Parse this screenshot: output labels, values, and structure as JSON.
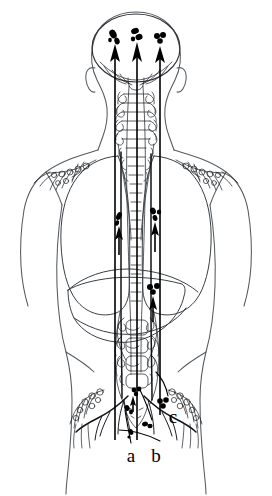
{
  "figure": {
    "view": "posterior",
    "background_color": "#ffffff",
    "line_color": "#1c2024",
    "lesion_color": "#000000"
  },
  "labels": [
    {
      "id": "a",
      "text": "a",
      "x": 131,
      "y": 455
    },
    {
      "id": "b",
      "text": "b",
      "x": 155,
      "y": 455
    },
    {
      "id": "c",
      "text": "c",
      "x": 171,
      "y": 419
    }
  ],
  "lesion_sites": [
    {
      "name": "brain-lesion-left",
      "cx": 114,
      "cy": 37
    },
    {
      "name": "brain-lesion-center",
      "cx": 137,
      "cy": 35
    },
    {
      "name": "brain-lesion-right",
      "cx": 160,
      "cy": 39
    },
    {
      "name": "lung-lesion-left",
      "cx": 119,
      "cy": 219
    },
    {
      "name": "lung-lesion-right",
      "cx": 155,
      "cy": 215
    },
    {
      "name": "liver-lesion",
      "cx": 153,
      "cy": 289
    },
    {
      "name": "lumbar-lesion",
      "cx": 137,
      "cy": 392
    },
    {
      "name": "pelvic-lesion-a",
      "cx": 128,
      "cy": 411
    },
    {
      "name": "pelvic-lesion-b",
      "cx": 147,
      "cy": 425
    },
    {
      "name": "pelvic-lesion-c",
      "cx": 163,
      "cy": 404
    }
  ],
  "flow_arrows": [
    {
      "name": "arrow-to-brain-left",
      "x1": 115,
      "y1": 440,
      "x2": 115,
      "y2": 46
    },
    {
      "name": "arrow-to-brain-center",
      "x1": 137,
      "y1": 440,
      "x2": 137,
      "y2": 46
    },
    {
      "name": "arrow-to-brain-right",
      "x1": 160,
      "y1": 415,
      "x2": 160,
      "y2": 50
    },
    {
      "name": "arrow-to-lung-left",
      "x1": 119,
      "y1": 250,
      "x2": 119,
      "y2": 228
    },
    {
      "name": "arrow-to-lung-right",
      "x1": 155,
      "y1": 250,
      "x2": 155,
      "y2": 224
    },
    {
      "name": "arrow-to-liver",
      "x1": 153,
      "y1": 320,
      "x2": 153,
      "y2": 297
    }
  ],
  "anatomy_parts": [
    "head-outline",
    "skull-cranial-vault",
    "ear-left",
    "ear-right",
    "neck-outline",
    "shoulder-left",
    "shoulder-right",
    "arm-left",
    "arm-right",
    "torso-outline",
    "hip-outline",
    "lung-left",
    "lung-right",
    "diaphragm",
    "liver",
    "cervical-spine",
    "thoracic-spine",
    "lumbar-spine",
    "sacrum",
    "vertebral-venous-plexus",
    "azygos-vein",
    "inferior-vena-cava",
    "iliac-vessels-left",
    "iliac-vessels-right",
    "axillary-plexus-left",
    "axillary-plexus-right",
    "pelvic-plexus-left",
    "pelvic-plexus-right"
  ]
}
